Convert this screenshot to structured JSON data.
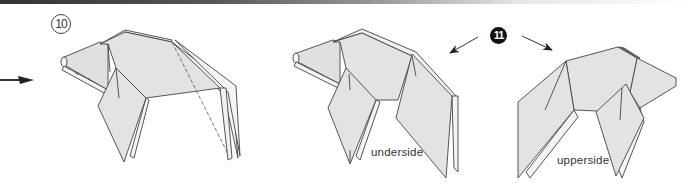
{
  "diagram": {
    "colors": {
      "paper_fill": "#e3e3e3",
      "paper_light": "#f4f4f4",
      "line": "#444444",
      "arrow": "#222222",
      "step_11_badge": "#111111"
    },
    "steps": [
      {
        "number": "10",
        "style": "outlined-circle"
      },
      {
        "number": "11",
        "style": "filled-circle"
      }
    ],
    "figures": [
      {
        "id": "step-10-figure",
        "note": "folded model with dashed fold line",
        "label": ""
      },
      {
        "id": "step-11-result-underside",
        "label": "underside"
      },
      {
        "id": "step-11-result-upperside",
        "label": "upperside"
      }
    ],
    "labels": {
      "step10": "10",
      "step11": "11",
      "underside": "underside",
      "upperside": "upperside"
    },
    "arrows": [
      {
        "id": "left-edge-arrow",
        "direction": "right"
      },
      {
        "id": "step-11-left-arrow",
        "direction": "down-left"
      },
      {
        "id": "step-11-right-arrow",
        "direction": "down-right"
      }
    ]
  }
}
